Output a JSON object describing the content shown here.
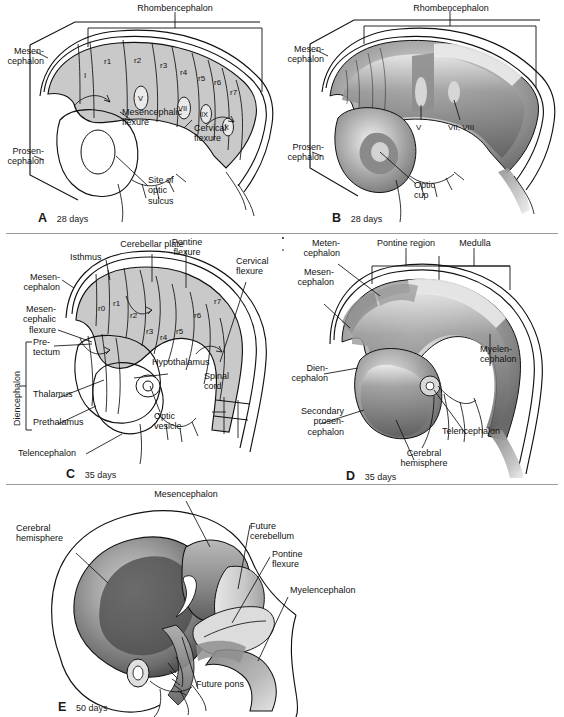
{
  "figure": {
    "background": "#ffffff",
    "ink": "#111111",
    "fill_light": "#c9c9c9",
    "fill_mid": "#9b9b9b",
    "fill_dark": "#6e6e6e",
    "rule_color": "#9a9a9a"
  },
  "panels": [
    {
      "id": "A",
      "letter": "A",
      "days": "28 days",
      "style": "line-drawing",
      "brackets": [
        {
          "label": "Rhombencephalon"
        }
      ],
      "labels": [
        "Rhombencephalon",
        "Mesen-\ncephalon",
        "Prosen-\ncephalon",
        "Mesencephalic\nflexure",
        "Cervical\nflexure",
        "Site of\noptic\nsulcus"
      ],
      "segments": [
        "I",
        "r1",
        "r2",
        "r3",
        "r4",
        "r5",
        "r6",
        "r7"
      ],
      "ganglia": [
        "V",
        "VII",
        "IX",
        "X"
      ]
    },
    {
      "id": "B",
      "letter": "B",
      "days": "28 days",
      "style": "shaded",
      "brackets": [
        {
          "label": "Rhombencephalon"
        }
      ],
      "labels": [
        "Rhombencephalon",
        "Mesen-\ncephalon",
        "Prosen-\ncephalon",
        "Optic\ncup"
      ],
      "ganglia": [
        "V",
        "VII, VIII"
      ]
    },
    {
      "id": "C",
      "letter": "C",
      "days": "35 days",
      "style": "line-drawing",
      "brackets": [
        {
          "label": "Diencephalon",
          "orientation": "vertical",
          "children": [
            "Pre-\ntectum",
            "Thalamus",
            "Prethalamus"
          ]
        }
      ],
      "labels": [
        "Cerebellar plate",
        "Pontine\nflexure",
        "Isthmus",
        "Cervical\nflexure",
        "Mesen-\ncephalon",
        "Mesen-\ncephalic\nflexure",
        "Diencephalon",
        "Pre-\ntectum",
        "Thalamus",
        "Prethalamus",
        "Telencephalon",
        "Hypothalamus",
        "Optic\nvesicle",
        "Spinal\ncord"
      ],
      "segments": [
        "r0",
        "r1",
        "r2",
        "r3",
        "r4",
        "r5",
        "r6",
        "r7"
      ]
    },
    {
      "id": "D",
      "letter": "D",
      "days": "35 days",
      "style": "shaded",
      "brackets": [
        {
          "label": "Pontine region"
        },
        {
          "label": "Medulla"
        }
      ],
      "labels": [
        "Meten-\ncephalon",
        "Pontine region",
        "Medulla",
        "Mesen-\ncephalon",
        "Myelen-\ncephalon",
        "Dien-\ncephalon",
        "Secondary\nprosen-\ncephalon",
        "Telencephalon",
        "Cerebral\nhemisphere"
      ]
    },
    {
      "id": "E",
      "letter": "E",
      "days": "50 days",
      "style": "shaded",
      "brackets": [],
      "labels": [
        "Mesencephalon",
        "Cerebral\nhemisphere",
        "Future\ncerebellum",
        "Pontine\nflexure",
        "Myelencephalon",
        "Future pons"
      ]
    }
  ]
}
